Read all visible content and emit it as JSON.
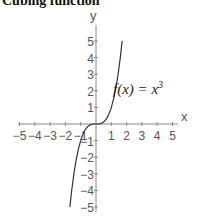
{
  "title": "Cubing function",
  "chart_data": {
    "type": "line",
    "title": "Cubing function",
    "xlabel": "x",
    "ylabel": "y",
    "xlim": [
      -5,
      5
    ],
    "ylim": [
      -5,
      5
    ],
    "x_ticks": [
      "-5",
      "-4",
      "-3",
      "-2",
      "-1",
      "1",
      "2",
      "3",
      "4",
      "5"
    ],
    "y_ticks": [
      "5",
      "4",
      "3",
      "2",
      "1",
      "-1",
      "-2",
      "-3",
      "-4",
      "-5"
    ],
    "grid": false,
    "annotation": "f(x) = x^3",
    "series": [
      {
        "name": "f(x) = x^3",
        "x": [
          -1.71,
          -1.5,
          -1.25,
          -1,
          -0.75,
          -0.5,
          -0.25,
          0,
          0.25,
          0.5,
          0.75,
          1,
          1.25,
          1.5,
          1.71
        ],
        "y": [
          -5,
          -3.375,
          -1.953,
          -1,
          -0.422,
          -0.125,
          -0.016,
          0,
          0.016,
          0.125,
          0.422,
          1,
          1.953,
          3.375,
          5
        ]
      }
    ]
  },
  "labels": {
    "x_axis": "x",
    "y_axis": "y",
    "annotation_lhs": "f(x) = x",
    "annotation_exp": "3"
  }
}
